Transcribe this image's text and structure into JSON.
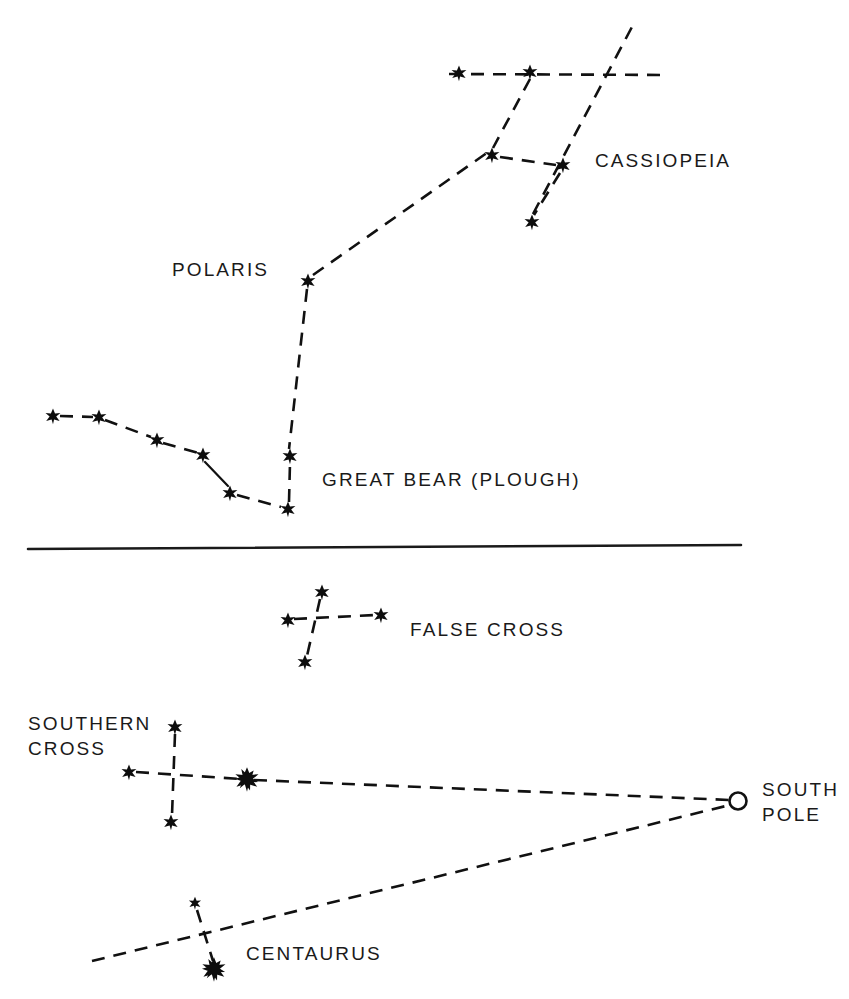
{
  "figure": {
    "background_color": "#ffffff",
    "ink_color": "#111111",
    "width": 849,
    "height": 999
  },
  "divider": {
    "name": "horizontal-divider",
    "x1": 28,
    "y1": 549,
    "x2": 741,
    "y2": 545
  },
  "labels": [
    {
      "id": "cassiopeia",
      "text": "CASSIOPEIA",
      "x": 595,
      "y": 167
    },
    {
      "id": "polaris",
      "text": "POLARIS",
      "x": 172,
      "y": 276
    },
    {
      "id": "great-bear",
      "text": "GREAT BEAR (PLOUGH)",
      "x": 322,
      "y": 486
    },
    {
      "id": "false-cross",
      "text": "FALSE CROSS",
      "x": 410,
      "y": 636
    },
    {
      "id": "southern-cross-1",
      "text": "SOUTHERN",
      "x": 28,
      "y": 730
    },
    {
      "id": "southern-cross-2",
      "text": "CROSS",
      "x": 28,
      "y": 755
    },
    {
      "id": "south-pole-1",
      "text": "SOUTH",
      "x": 762,
      "y": 796
    },
    {
      "id": "south-pole-2",
      "text": "POLE",
      "x": 762,
      "y": 821
    },
    {
      "id": "centaurus",
      "text": "CENTAURUS",
      "x": 246,
      "y": 960
    }
  ],
  "chart_data": {
    "type": "scatter",
    "xlabel": "",
    "ylabel": "",
    "xlim": [
      0,
      849
    ],
    "ylim": [
      0,
      999
    ],
    "grid": false,
    "legend": "none",
    "annotations": [
      "CASSIOPEIA",
      "POLARIS",
      "GREAT BEAR (PLOUGH)",
      "FALSE CROSS",
      "SOUTHERN CROSS",
      "SOUTH POLE",
      "CENTAURUS"
    ],
    "groups": [
      {
        "name": "Cassiopeia",
        "hemisphere": "northern",
        "stars": [
          {
            "id": "cas-a",
            "x": 459,
            "y": 73,
            "size": "normal"
          },
          {
            "id": "cas-b",
            "x": 530,
            "y": 72,
            "size": "normal"
          },
          {
            "id": "cas-c",
            "x": 492,
            "y": 155,
            "size": "normal"
          },
          {
            "id": "cas-d",
            "x": 563,
            "y": 165,
            "size": "normal"
          },
          {
            "id": "cas-e",
            "x": 532,
            "y": 222,
            "size": "normal"
          }
        ]
      },
      {
        "name": "Polaris",
        "hemisphere": "northern",
        "stars": [
          {
            "id": "polaris",
            "x": 308,
            "y": 281,
            "size": "normal"
          }
        ]
      },
      {
        "name": "Great Bear (Plough)",
        "hemisphere": "northern",
        "stars": [
          {
            "id": "ub-a",
            "x": 53,
            "y": 416,
            "size": "normal"
          },
          {
            "id": "ub-b",
            "x": 99,
            "y": 417,
            "size": "normal"
          },
          {
            "id": "ub-c",
            "x": 157,
            "y": 440,
            "size": "normal"
          },
          {
            "id": "ub-d",
            "x": 203,
            "y": 455,
            "size": "normal"
          },
          {
            "id": "ub-e",
            "x": 230,
            "y": 493,
            "size": "normal"
          },
          {
            "id": "ub-f",
            "x": 288,
            "y": 509,
            "size": "normal"
          },
          {
            "id": "ub-g",
            "x": 290,
            "y": 456,
            "size": "normal"
          }
        ]
      },
      {
        "name": "False Cross",
        "hemisphere": "southern",
        "stars": [
          {
            "id": "fc-top",
            "x": 322,
            "y": 592,
            "size": "normal"
          },
          {
            "id": "fc-left",
            "x": 288,
            "y": 620,
            "size": "normal"
          },
          {
            "id": "fc-right",
            "x": 381,
            "y": 615,
            "size": "normal"
          },
          {
            "id": "fc-bottom",
            "x": 305,
            "y": 662,
            "size": "normal"
          }
        ]
      },
      {
        "name": "Southern Cross",
        "hemisphere": "southern",
        "stars": [
          {
            "id": "sc-top",
            "x": 175,
            "y": 727,
            "size": "normal"
          },
          {
            "id": "sc-left",
            "x": 129,
            "y": 772,
            "size": "normal"
          },
          {
            "id": "sc-bottom",
            "x": 171,
            "y": 822,
            "size": "normal"
          },
          {
            "id": "sc-pointer",
            "x": 247,
            "y": 779,
            "size": "bold"
          }
        ]
      },
      {
        "name": "Centaurus",
        "hemisphere": "southern",
        "stars": [
          {
            "id": "cen-top",
            "x": 195,
            "y": 903,
            "size": "small"
          },
          {
            "id": "cen-bright",
            "x": 214,
            "y": 969,
            "size": "bold"
          }
        ]
      }
    ],
    "markers": [
      {
        "id": "south-pole",
        "shape": "open-circle",
        "x": 738,
        "y": 801,
        "r": 8.5
      }
    ],
    "links": [
      {
        "id": "cas-top-line",
        "style": "dashed",
        "points": [
          [
            449,
            74
          ],
          [
            668,
            75
          ]
        ]
      },
      {
        "id": "cas-b-to-c",
        "style": "dashed",
        "points": [
          [
            530,
            79
          ],
          [
            493,
            148
          ]
        ]
      },
      {
        "id": "cas-c-to-d",
        "style": "dashed",
        "points": [
          [
            500,
            157
          ],
          [
            556,
            165
          ]
        ]
      },
      {
        "id": "cas-d-to-e",
        "style": "dashed",
        "points": [
          [
            560,
            173
          ],
          [
            534,
            215
          ]
        ]
      },
      {
        "id": "cas-e-steep-upper",
        "style": "dashed",
        "points": [
          [
            533,
            214
          ],
          [
            633,
            25
          ]
        ]
      },
      {
        "id": "pointer-polaris-to-cas",
        "style": "dashed",
        "points": [
          [
            313,
            275
          ],
          [
            491,
            150
          ]
        ]
      },
      {
        "id": "pointer-polaris-to-bowl",
        "style": "dashed",
        "points": [
          [
            307,
            289
          ],
          [
            289,
            449
          ]
        ]
      },
      {
        "id": "ub-a-b",
        "style": "dashed",
        "points": [
          [
            60,
            416
          ],
          [
            93,
            417
          ]
        ]
      },
      {
        "id": "ub-b-c",
        "style": "dashed",
        "points": [
          [
            105,
            420
          ],
          [
            151,
            437
          ]
        ]
      },
      {
        "id": "ub-c-d",
        "style": "dashed",
        "points": [
          [
            163,
            443
          ],
          [
            198,
            453
          ]
        ]
      },
      {
        "id": "ub-d-e",
        "style": "solid",
        "points": [
          [
            205,
            462
          ],
          [
            228,
            486
          ]
        ]
      },
      {
        "id": "ub-e-f",
        "style": "dashed",
        "points": [
          [
            237,
            495
          ],
          [
            281,
            507
          ]
        ]
      },
      {
        "id": "ub-f-g",
        "style": "dashed",
        "points": [
          [
            289,
            502
          ],
          [
            290,
            463
          ]
        ]
      },
      {
        "id": "fc-horizontal",
        "style": "dashed",
        "points": [
          [
            294,
            619
          ],
          [
            375,
            615
          ]
        ]
      },
      {
        "id": "fc-vertical",
        "style": "dashed",
        "points": [
          [
            320,
            599
          ],
          [
            307,
            656
          ]
        ]
      },
      {
        "id": "sc-horizontal",
        "style": "dashed",
        "points": [
          [
            136,
            772
          ],
          [
            241,
            779
          ]
        ]
      },
      {
        "id": "sc-vertical",
        "style": "dashed",
        "points": [
          [
            175,
            734
          ],
          [
            172,
            815
          ]
        ]
      },
      {
        "id": "pointer-sc-to-pole",
        "style": "dashed",
        "points": [
          [
            254,
            780
          ],
          [
            730,
            800
          ]
        ]
      },
      {
        "id": "pointer-cen-to-pole",
        "style": "dashed",
        "points": [
          [
            92,
            961
          ],
          [
            730,
            805
          ]
        ]
      },
      {
        "id": "cen-vertical",
        "style": "dashed",
        "points": [
          [
            197,
            910
          ],
          [
            213,
            961
          ]
        ]
      }
    ]
  }
}
